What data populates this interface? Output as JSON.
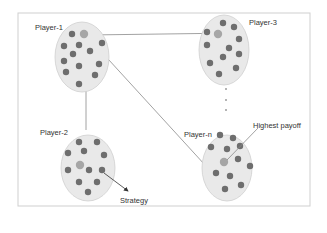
{
  "diagram": {
    "colors": {
      "frame": "#c8c8c8",
      "cluster_fill": "#e9e9e9",
      "cluster_stroke": "#cfcfcf",
      "dot": "#6e6e6e",
      "highlight_dot": "#a6a6a6",
      "edge": "#8a8a8a"
    },
    "labels": {
      "player1": "Player-1",
      "player2": "Player-2",
      "player3": "Player-3",
      "playern": "Player-n",
      "strategy": "Strategy",
      "highest_payoff": "Highest payoff",
      "ellipsis": "⋮"
    },
    "clusters": [
      {
        "id": "player-1",
        "label": "Player-1"
      },
      {
        "id": "player-2",
        "label": "Player-2"
      },
      {
        "id": "player-3",
        "label": "Player-3"
      },
      {
        "id": "player-n",
        "label": "Player-n"
      }
    ],
    "edges": [
      {
        "from": "Player-1",
        "to": "Player-3"
      },
      {
        "from": "Player-1",
        "to": "Player-2"
      },
      {
        "from": "Player-1",
        "to": "Player-n"
      }
    ],
    "annotations": [
      {
        "text": "Strategy",
        "points_to": "dot in Player-2"
      },
      {
        "text": "Highest payoff",
        "points_to": "highlighted dot in Player-n"
      }
    ]
  }
}
